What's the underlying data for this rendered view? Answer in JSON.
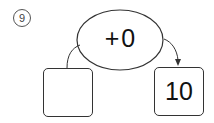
{
  "problem": {
    "number_label": "9",
    "operation": "+0",
    "input_value": "",
    "output_value": "10"
  }
}
